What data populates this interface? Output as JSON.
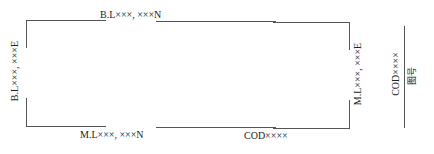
{
  "frame": {
    "top_label": "B.L×××, ×××N",
    "left_label": "B.L×××, ×××E",
    "bottom_label": "M.L×××, ×××N",
    "right_label": "M.L×××, ×××E",
    "bottom_code_label": "COD××××"
  },
  "title_block": {
    "code_label": "COD××××",
    "figure_number_label": "图号"
  },
  "colors": {
    "line": "#555555",
    "text": "#222222"
  }
}
